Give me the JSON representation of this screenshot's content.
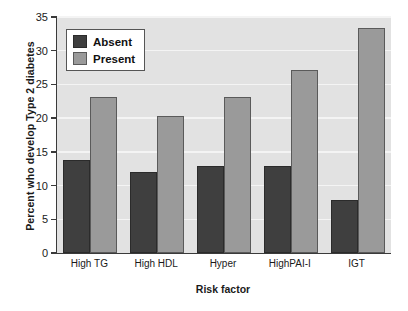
{
  "chart_data": {
    "type": "bar",
    "title": "",
    "xlabel": "Risk factor",
    "ylabel": "Percent who develop Type 2 diabetes",
    "categories": [
      "High TG",
      "High HDL",
      "Hyper",
      "HighPAI-I",
      "IGT"
    ],
    "series": [
      {
        "name": "Absent",
        "color": "#3f3f3f",
        "values": [
          13.8,
          12.0,
          12.9,
          12.9,
          7.9
        ]
      },
      {
        "name": "Present",
        "color": "#9a9a9a",
        "values": [
          23.1,
          20.3,
          23.1,
          27.2,
          33.3
        ]
      }
    ],
    "ylim": [
      0,
      35
    ],
    "yticks": [
      0,
      5,
      10,
      15,
      20,
      25,
      30,
      35
    ],
    "ytick_labels": [
      "0",
      "5",
      "10",
      "15",
      "20",
      "25",
      "30",
      "35"
    ],
    "grid": true,
    "grid_axis": "y",
    "legend_position": "upper-left",
    "plot_background": "#e2e2e2",
    "gridline_color": "#f4f4f4",
    "axis_color": "#3a3a3a"
  }
}
